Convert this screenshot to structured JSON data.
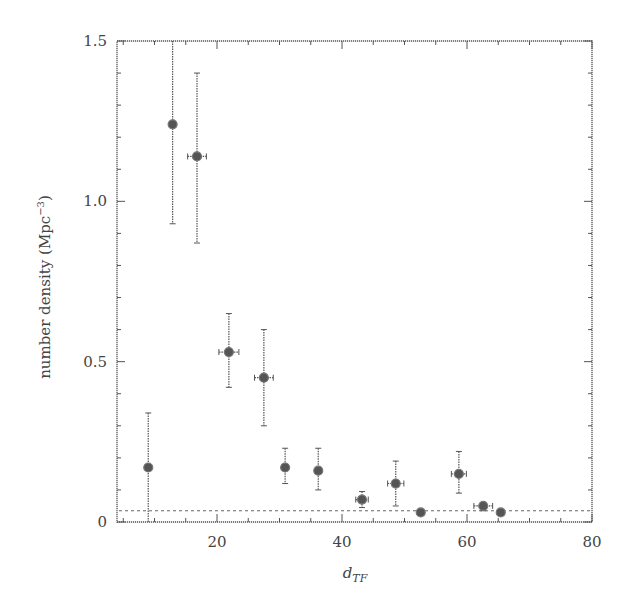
{
  "chart_data": {
    "type": "scatter",
    "title": "",
    "xlabel": "d_TF",
    "xlabel_main": "d",
    "xlabel_sub": "TF",
    "ylabel": "number density (Mpc^-3)",
    "ylabel_main": "number density (Mpc",
    "ylabel_sup": "−3",
    "ylabel_close": ")",
    "xlim": [
      4,
      80
    ],
    "ylim": [
      0,
      1.5
    ],
    "xticks": [
      20,
      40,
      60,
      80
    ],
    "xtick_labels": [
      "20",
      "40",
      "60",
      "80"
    ],
    "yticks": [
      0,
      0.5,
      1.0,
      1.5
    ],
    "ytick_labels": [
      "0",
      "0.5",
      "1.0",
      "1.5"
    ],
    "x_minor_step": 5,
    "y_minor_step": 0.1,
    "grid": false,
    "legend": null,
    "reference_line": {
      "type": "horizontal",
      "y": 0.035,
      "style": "dotted"
    },
    "series": [
      {
        "name": "number density",
        "points": [
          {
            "x": 9.0,
            "y": 0.17,
            "y_low": 0.0,
            "y_high": 0.34,
            "x_err": 0
          },
          {
            "x": 12.9,
            "y": 1.24,
            "y_low": 0.93,
            "y_high": 1.5,
            "x_err": 0
          },
          {
            "x": 16.8,
            "y": 1.14,
            "y_low": 0.87,
            "y_high": 1.4,
            "x_err": 1.5
          },
          {
            "x": 21.9,
            "y": 0.53,
            "y_low": 0.42,
            "y_high": 0.65,
            "x_err": 1.6
          },
          {
            "x": 27.5,
            "y": 0.45,
            "y_low": 0.3,
            "y_high": 0.6,
            "x_err": 1.5
          },
          {
            "x": 30.9,
            "y": 0.17,
            "y_low": 0.12,
            "y_high": 0.23,
            "x_err": 0
          },
          {
            "x": 36.2,
            "y": 0.16,
            "y_low": 0.1,
            "y_high": 0.23,
            "x_err": 0
          },
          {
            "x": 43.2,
            "y": 0.07,
            "y_low": 0.045,
            "y_high": 0.095,
            "x_err": 1.0
          },
          {
            "x": 48.6,
            "y": 0.12,
            "y_low": 0.05,
            "y_high": 0.19,
            "x_err": 1.3
          },
          {
            "x": 52.6,
            "y": 0.03,
            "y_low": 0.03,
            "y_high": 0.03,
            "x_err": 0
          },
          {
            "x": 58.7,
            "y": 0.15,
            "y_low": 0.09,
            "y_high": 0.22,
            "x_err": 1.2
          },
          {
            "x": 62.6,
            "y": 0.05,
            "y_low": 0.035,
            "y_high": 0.06,
            "x_err": 1.5
          },
          {
            "x": 65.4,
            "y": 0.03,
            "y_low": 0.03,
            "y_high": 0.03,
            "x_err": 0
          }
        ]
      }
    ]
  },
  "colors": {
    "ink": "#555555",
    "marker_fill": "#555555",
    "background": "#ffffff"
  }
}
